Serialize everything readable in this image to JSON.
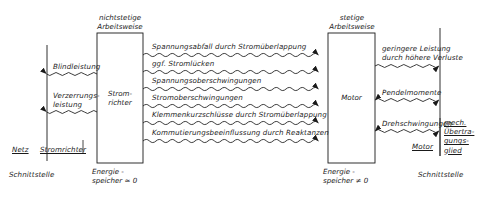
{
  "diagram": {
    "title_absent": "",
    "boxes": [
      {
        "id": "converter",
        "label": "Strom-\nrichter",
        "caption_top": "nichtstetige\nArbeitsweise",
        "caption_bottom": "Energie -\nspeicher ≈ 0"
      },
      {
        "id": "motor",
        "label": "Motor",
        "caption_top": "stetige\nArbeitsweise",
        "caption_bottom": "Energie -\nspeicher ≠ 0"
      }
    ],
    "left_interface": {
      "left_label": "Netz",
      "right_label": "Stromrichter",
      "caption": "Schnittstelle"
    },
    "right_interface": {
      "left_label": "Motor",
      "right_label": "mech.\nÜbertra-\ngungs-\nglied",
      "caption": "Schnittstelle"
    },
    "left_flows": [
      {
        "label": "Blindleistung",
        "direction": "left"
      },
      {
        "label": "Verzerrungs-\nleistung",
        "direction": "left"
      }
    ],
    "middle_flows": [
      {
        "label": "Spannungsabfall durch Stromüberlappung",
        "direction": "right"
      },
      {
        "label": "ggf. Stromlücken",
        "direction": "right"
      },
      {
        "label": "Spannungsoberschwingungen",
        "direction": "right"
      },
      {
        "label": "Stromoberschwingungen",
        "direction": "right"
      },
      {
        "label": "Klemmenkurzschlüsse durch Stromüberlappung",
        "direction": "right"
      },
      {
        "label": "Kommutierungsbeeinflussung durch Reaktanzen",
        "direction": "right"
      }
    ],
    "right_flows": [
      {
        "label": "geringere Leistung\ndurch höhere Verluste",
        "direction": "right"
      },
      {
        "label": "Pendelmomente",
        "direction": "both"
      },
      {
        "label": "Drehschwingungen",
        "direction": "both"
      }
    ],
    "colors": {
      "ink": "#1a1a1a",
      "paper": "#ffffff"
    }
  }
}
